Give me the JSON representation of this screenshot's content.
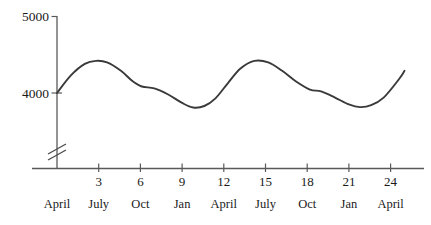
{
  "chart_data": {
    "type": "line",
    "title": "",
    "xlabel": "",
    "ylabel": "",
    "grid": false,
    "legend": "none",
    "y_axis": {
      "ticks": [
        4000,
        5000
      ],
      "tick_labels": [
        "4000",
        "5000"
      ],
      "ylim": [
        3700,
        5000
      ],
      "axis_break": true,
      "axis_break_symbol": "double-slash"
    },
    "x_axis": {
      "numeric_ticks": [
        3,
        6,
        9,
        12,
        15,
        18,
        21,
        24
      ],
      "numeric_tick_labels": [
        "3",
        "6",
        "9",
        "12",
        "15",
        "18",
        "21",
        "24"
      ],
      "month_labels": [
        "April",
        "July",
        "Oct",
        "Jan",
        "April",
        "July",
        "Oct",
        "Jan",
        "April"
      ],
      "month_positions": [
        0,
        3,
        6,
        9,
        12,
        15,
        18,
        21,
        24
      ],
      "xlim": [
        0,
        26
      ]
    },
    "series": [
      {
        "name": "series-1",
        "color": "#3a3a3a",
        "x": [
          0,
          1,
          2,
          2.8,
          3.6,
          4.6,
          5.4,
          6.1,
          7,
          8,
          9,
          9.8,
          10.6,
          11.4,
          12.3,
          13.2,
          14.2,
          15.2,
          16.2,
          17.2,
          18.2,
          19,
          20,
          21,
          21.8,
          22.6,
          23.5,
          24.6,
          25
        ],
        "y": [
          4000,
          4230,
          4380,
          4420,
          4400,
          4290,
          4160,
          4085,
          4060,
          3980,
          3870,
          3810,
          3830,
          3930,
          4130,
          4320,
          4420,
          4400,
          4290,
          4150,
          4045,
          4020,
          3940,
          3850,
          3815,
          3840,
          3940,
          4180,
          4290
        ]
      }
    ]
  }
}
